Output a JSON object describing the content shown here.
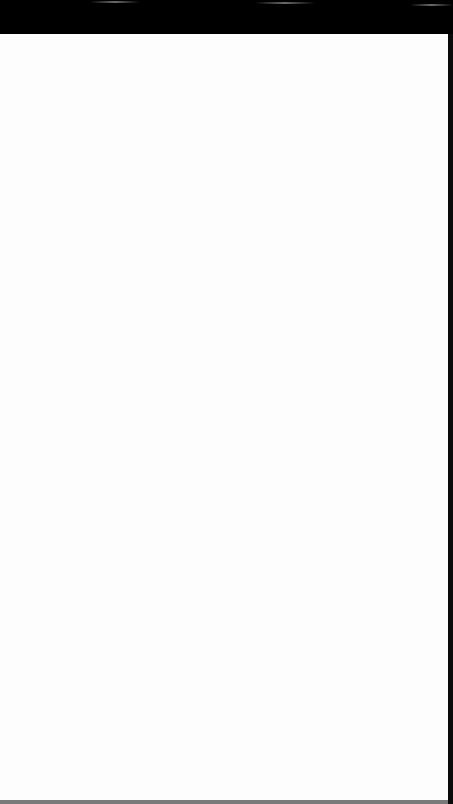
{
  "screen": {
    "state": "blank",
    "colors": {
      "status_bar": "#000000",
      "content_background": "#fdfdfd",
      "right_edge": "#0a0a0a",
      "bottom_edge": "#7a7a7a"
    }
  }
}
